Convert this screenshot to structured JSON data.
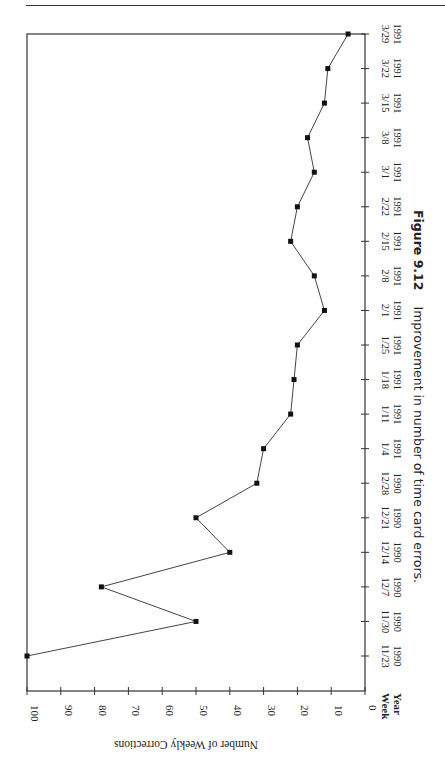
{
  "figure": {
    "number_label": "Figure 9.12",
    "caption_text": "Improvement in number of time card errors."
  },
  "chart_data": {
    "type": "line",
    "orientation": "rotated-90-clockwise",
    "title": "Improvement in number of time card errors.",
    "xlabel": "Week / Year",
    "ylabel": "Number of Weekly Corrections",
    "ylim": [
      0,
      100
    ],
    "yticks": [
      0,
      10,
      20,
      30,
      40,
      50,
      60,
      70,
      80,
      90,
      100
    ],
    "grid": false,
    "legend": null,
    "category_row_labels": [
      "Week",
      "Year"
    ],
    "categories": [
      {
        "week": "11/23",
        "year": "1990"
      },
      {
        "week": "11/30",
        "year": "1990"
      },
      {
        "week": "12/7",
        "year": "1990"
      },
      {
        "week": "12/14",
        "year": "1990"
      },
      {
        "week": "12/21",
        "year": "1990"
      },
      {
        "week": "12/28",
        "year": "1990"
      },
      {
        "week": "1/4",
        "year": "1991"
      },
      {
        "week": "1/11",
        "year": "1991"
      },
      {
        "week": "1/18",
        "year": "1991"
      },
      {
        "week": "1/25",
        "year": "1991"
      },
      {
        "week": "2/1",
        "year": "1991"
      },
      {
        "week": "2/8",
        "year": "1991"
      },
      {
        "week": "2/15",
        "year": "1991"
      },
      {
        "week": "2/22",
        "year": "1991"
      },
      {
        "week": "3/1",
        "year": "1991"
      },
      {
        "week": "3/8",
        "year": "1991"
      },
      {
        "week": "3/15",
        "year": "1991"
      },
      {
        "week": "3/22",
        "year": "1991"
      },
      {
        "week": "3/29",
        "year": "1991"
      }
    ],
    "series": [
      {
        "name": "Weekly Corrections",
        "marker": "square",
        "values": [
          100,
          50,
          78,
          40,
          50,
          32,
          30,
          22,
          21,
          20,
          12,
          15,
          22,
          20,
          15,
          17,
          12,
          11,
          5
        ]
      }
    ]
  }
}
